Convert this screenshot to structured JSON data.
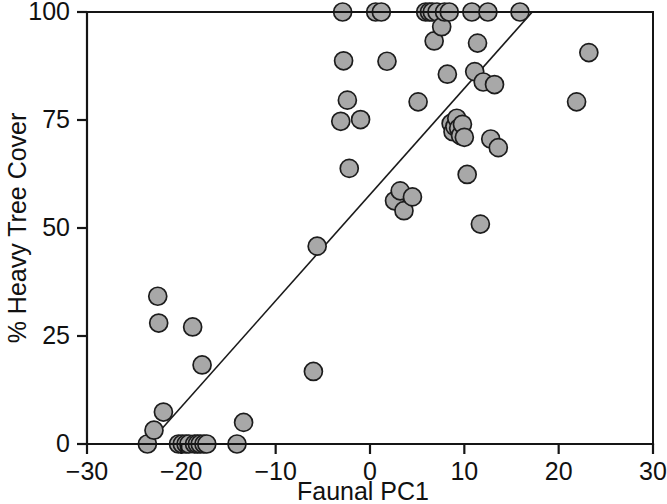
{
  "chart_data": {
    "type": "scatter",
    "title": "",
    "xlabel": "Faunal PC1",
    "ylabel": "% Heavy Tree Cover",
    "xlim": [
      -30,
      30
    ],
    "ylim": [
      0,
      100
    ],
    "xticks": [
      -30,
      -20,
      -10,
      0,
      10,
      20,
      30
    ],
    "xticklabels": [
      "−30",
      "−20",
      "−10",
      "0",
      "10",
      "20",
      "30"
    ],
    "yticks": [
      0,
      25,
      50,
      75,
      100
    ],
    "yticklabels": [
      "0",
      "25",
      "50",
      "75",
      "100"
    ],
    "grid": false,
    "legend": null,
    "marker_style": {
      "shape": "circle",
      "fill_color": "#a8a8a8",
      "edge_color": "#1c1c1c",
      "radius_px": 9
    },
    "fit_line": {
      "type": "linear-regression",
      "color": "#1a1a1a",
      "x_start": -23.5,
      "y_start": 0,
      "x_end": 17.2,
      "y_end": 100
    },
    "series": [
      {
        "name": "sites",
        "points": [
          [
            -23.6,
            0
          ],
          [
            -22.9,
            3.2
          ],
          [
            -22.5,
            34.2
          ],
          [
            -22.4,
            28.0
          ],
          [
            -21.9,
            7.4
          ],
          [
            -20.3,
            0
          ],
          [
            -19.9,
            0
          ],
          [
            -19.5,
            0
          ],
          [
            -19.2,
            0
          ],
          [
            -18.8,
            27.1
          ],
          [
            -18.6,
            0
          ],
          [
            -18.3,
            0
          ],
          [
            -18.0,
            0
          ],
          [
            -17.8,
            18.3
          ],
          [
            -17.6,
            0
          ],
          [
            -17.3,
            0
          ],
          [
            -14.1,
            0
          ],
          [
            -13.4,
            5.0
          ],
          [
            -6.0,
            16.8
          ],
          [
            -5.6,
            45.8
          ],
          [
            -3.1,
            74.7
          ],
          [
            -2.9,
            100
          ],
          [
            -2.8,
            88.7
          ],
          [
            -2.4,
            79.6
          ],
          [
            -2.2,
            63.8
          ],
          [
            -1.0,
            75.1
          ],
          [
            0.6,
            100
          ],
          [
            1.2,
            100
          ],
          [
            1.8,
            88.6
          ],
          [
            2.6,
            56.3
          ],
          [
            3.2,
            58.6
          ],
          [
            3.6,
            54.0
          ],
          [
            4.5,
            57.2
          ],
          [
            5.1,
            79.2
          ],
          [
            5.9,
            100
          ],
          [
            6.3,
            100
          ],
          [
            6.6,
            100
          ],
          [
            6.8,
            93.3
          ],
          [
            7.1,
            100
          ],
          [
            7.6,
            96.6
          ],
          [
            7.9,
            100
          ],
          [
            8.2,
            85.6
          ],
          [
            8.4,
            100
          ],
          [
            8.6,
            74.2
          ],
          [
            8.8,
            72.3
          ],
          [
            9.0,
            73.5
          ],
          [
            9.2,
            75.4
          ],
          [
            9.4,
            73.1
          ],
          [
            9.6,
            71.4
          ],
          [
            9.8,
            74.0
          ],
          [
            10.0,
            71.0
          ],
          [
            10.3,
            62.4
          ],
          [
            10.8,
            100
          ],
          [
            11.1,
            86.2
          ],
          [
            11.4,
            92.8
          ],
          [
            11.7,
            50.9
          ],
          [
            12.0,
            83.8
          ],
          [
            12.5,
            100
          ],
          [
            12.8,
            70.6
          ],
          [
            13.2,
            83.2
          ],
          [
            13.6,
            68.6
          ],
          [
            15.9,
            100
          ],
          [
            21.9,
            79.2
          ],
          [
            23.2,
            90.6
          ]
        ]
      }
    ]
  },
  "geometry": {
    "plot_left_px": 87,
    "plot_right_px": 653,
    "plot_top_px": 12,
    "plot_bottom_px": 444
  }
}
